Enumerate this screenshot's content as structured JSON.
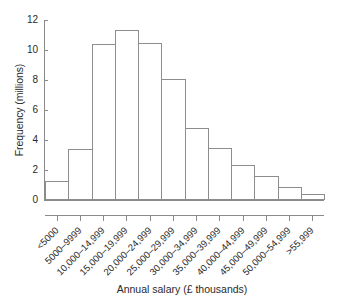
{
  "chart_data": {
    "type": "bar",
    "title": "",
    "xlabel": "Annual salary (£ thousands)",
    "ylabel": "Frequency (millions)",
    "ylim": [
      0,
      12
    ],
    "ytick_labels": [
      "0",
      "2",
      "4",
      "6",
      "8",
      "10",
      "12"
    ],
    "yticks": [
      0,
      2,
      4,
      6,
      8,
      10,
      12
    ],
    "grid": false,
    "legend": "none",
    "categories": [
      "<5000",
      "5000–9999",
      "10,000–14,999",
      "15,000–19,999",
      "20,000–24,999",
      "25,000–29,999",
      "30,000–34,999",
      "35,000–39,999",
      "40,000–44,999",
      "45,000–49,999",
      "50,000–54,999",
      ">55,999"
    ],
    "values": [
      1.3,
      3.4,
      10.4,
      11.35,
      10.5,
      8.1,
      4.8,
      3.5,
      2.35,
      1.6,
      0.9,
      0.4
    ],
    "bar_style": {
      "fill": "#ffffff",
      "edge": "#8d8d8d"
    }
  }
}
